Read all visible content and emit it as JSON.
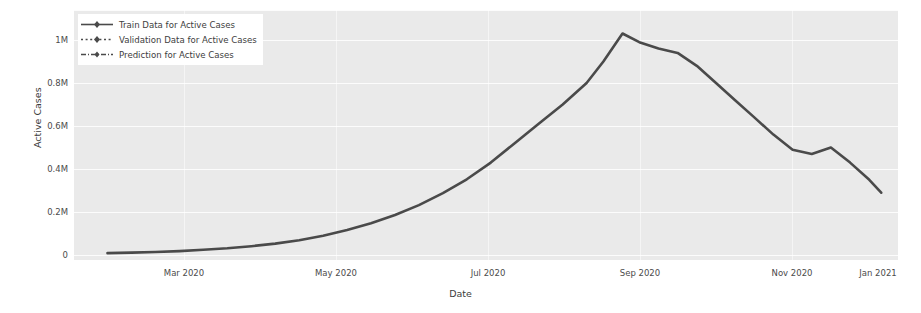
{
  "chart_data": {
    "type": "line",
    "title": "",
    "xlabel": "Date",
    "ylabel": "Active Cases",
    "grid": true,
    "legend_position": "upper left",
    "xlim": [
      "2020-02-01",
      "2021-01-10"
    ],
    "ylim": [
      0,
      1100000
    ],
    "yticks": [
      0,
      200000,
      400000,
      600000,
      800000,
      1000000
    ],
    "ytick_labels": [
      "0",
      "0.2M",
      "0.4M",
      "0.6M",
      "0.8M",
      "1M"
    ],
    "xticks": [
      "2020-03-01",
      "2020-05-01",
      "2020-07-01",
      "2020-09-01",
      "2020-11-01",
      "2021-01-01"
    ],
    "xtick_labels": [
      "Mar 2020",
      "May 2020",
      "Jul 2020",
      "Sep 2020",
      "Nov 2020",
      "Jan 2021"
    ],
    "series": [
      {
        "name": "Train Data for Active Cases",
        "color": "#4a4a4a",
        "linestyle": "solid",
        "marker": "diamond",
        "x": [
          "2020-02-15",
          "2020-02-25",
          "2020-03-06",
          "2020-03-16",
          "2020-03-26",
          "2020-04-05",
          "2020-04-15",
          "2020-04-25",
          "2020-05-05",
          "2020-05-15",
          "2020-05-25",
          "2020-06-04",
          "2020-06-14",
          "2020-06-24",
          "2020-07-04",
          "2020-07-14",
          "2020-07-24",
          "2020-08-03",
          "2020-08-13",
          "2020-08-23",
          "2020-09-02",
          "2020-09-09",
          "2020-09-17",
          "2020-09-24",
          "2020-10-02",
          "2020-10-10",
          "2020-10-18",
          "2020-10-26",
          "2020-11-03",
          "2020-11-11",
          "2020-11-19",
          "2020-11-27",
          "2020-12-05",
          "2020-12-13",
          "2020-12-21",
          "2020-12-29",
          "2021-01-03"
        ],
        "y": [
          9000,
          11000,
          14000,
          18000,
          24000,
          31000,
          41000,
          53000,
          69000,
          90000,
          116000,
          148000,
          186000,
          232000,
          288000,
          352000,
          430000,
          520000,
          610000,
          700000,
          800000,
          900000,
          1030000,
          990000,
          960000,
          940000,
          880000,
          800000,
          720000,
          640000,
          560000,
          490000,
          470000,
          500000,
          430000,
          350000,
          290000
        ]
      },
      {
        "name": "Validation Data for Active Cases",
        "color": "#4a4a4a",
        "linestyle": "dotted",
        "marker": "diamond",
        "x": [],
        "y": []
      },
      {
        "name": "Prediction for Active Cases",
        "color": "#4a4a4a",
        "linestyle": "dashdot",
        "marker": "diamond",
        "x": [],
        "y": []
      }
    ]
  },
  "axes": {
    "ytick_labels": [
      "1M",
      "0.8M",
      "0.6M",
      "0.4M",
      "0.2M",
      "0"
    ],
    "xtick_labels": [
      "Mar 2020",
      "May 2020",
      "Jul 2020",
      "Sep 2020",
      "Nov 2020",
      "Jan 2021"
    ],
    "ylabel": "Active Cases",
    "xlabel": "Date"
  },
  "legend": {
    "entries": [
      {
        "label": "Train Data for Active Cases"
      },
      {
        "label": "Validation Data for Active Cases"
      },
      {
        "label": "Prediction for Active Cases"
      }
    ]
  },
  "colors": {
    "line": "#4a4a4a",
    "plot_background": "#eaeaea",
    "grid": "#ffffff",
    "text": "#3d3d3d",
    "figure_background": "#ffffff"
  }
}
